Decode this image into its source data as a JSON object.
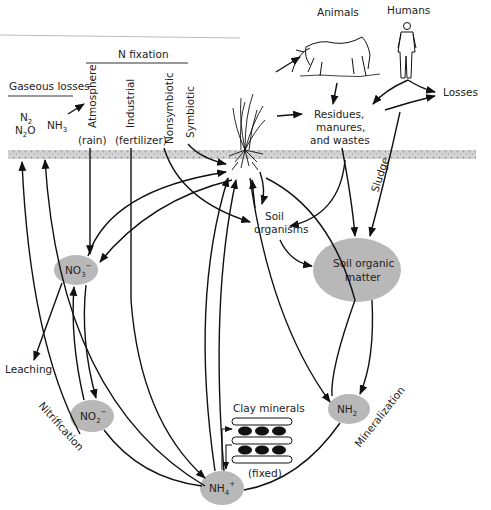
{
  "headers": {
    "n_fixation": "N fixation",
    "gaseous_losses": "Gaseous losses"
  },
  "gases": {
    "n2": "N",
    "n2_sub": "2",
    "n2o": "N",
    "n2o_sub": "2",
    "n2o_o": "O",
    "nh3": "NH",
    "nh3_sub": "3"
  },
  "fixation_sources": {
    "atmosphere": "Atmosphere",
    "atmosphere_note": "(rain)",
    "industrial": "Industrial",
    "industrial_note": "(fertilizer)",
    "nonsymbiotic": "Nonsymbiotic",
    "symbiotic": "Symbiotic"
  },
  "top": {
    "animals": "Animals",
    "humans": "Humans",
    "losses": "Losses",
    "residues_1": "Residues,",
    "residues_2": "manures,",
    "residues_3": "and wastes",
    "sludge": "Sludge"
  },
  "soil": {
    "organisms_1": "Soil",
    "organisms_2": "organisms",
    "organic_matter_1": "Soil organic",
    "organic_matter_2": "matter"
  },
  "nodes": {
    "no3": "NO",
    "no3_sub": "3",
    "no3_sup": "−",
    "no2": "NO",
    "no2_sub": "2",
    "no2_sup": "−",
    "nh2": "NH",
    "nh2_sub": "2",
    "nh4": "NH",
    "nh4_sub": "4",
    "nh4_sup": "+"
  },
  "processes": {
    "leaching": "Leaching",
    "nitrification": "Nitrification",
    "mineralization": "Mineralization"
  },
  "clay": {
    "title": "Clay minerals",
    "note": "(fixed)"
  },
  "colors": {
    "node_fill": "#b8b8b8",
    "soil_band": "#c9c9c9",
    "line": "#111111"
  }
}
